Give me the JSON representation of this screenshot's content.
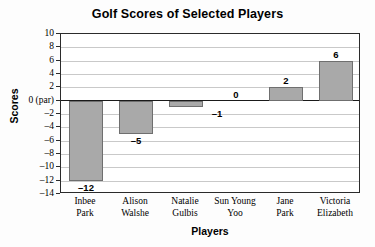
{
  "chart_data": {
    "type": "bar",
    "title": "Golf Scores of Selected Players",
    "xlabel": "Players",
    "ylabel": "Scores",
    "categories": [
      "Inbee Park",
      "Alison Walshe",
      "Natalie Gulbis",
      "Sun Young Yoo",
      "Jane Park",
      "Victoria Elizabeth"
    ],
    "category_lines": [
      [
        "Inbee",
        "Park"
      ],
      [
        "Alison",
        "Walshe"
      ],
      [
        "Natalie",
        "Gulbis"
      ],
      [
        "Sun Young",
        "Yoo"
      ],
      [
        "Jane",
        "Park"
      ],
      [
        "Victoria",
        "Elizabeth"
      ]
    ],
    "values": [
      -12,
      -5,
      -1,
      0,
      2,
      6
    ],
    "value_labels": [
      "–12",
      "–5",
      "–1",
      "0",
      "2",
      "6"
    ],
    "ylim": [
      -14,
      10
    ],
    "ytick_values": [
      10,
      8,
      6,
      4,
      2,
      0,
      -2,
      -4,
      -6,
      -8,
      -10,
      -12,
      -14
    ],
    "ytick_labels": [
      "10",
      "8",
      "6",
      "4",
      "2",
      "0 (par)",
      "–2",
      "–4",
      "–6",
      "–8",
      "–10",
      "–12",
      "–14"
    ],
    "grid": true,
    "legend": "none",
    "bar_color": "#a9a9a9",
    "bar_border_color": "#6f6f6f",
    "gridline_color": "#c9c9c9",
    "axis_color": "#2b2b2b",
    "background": "#fdfdfd"
  }
}
